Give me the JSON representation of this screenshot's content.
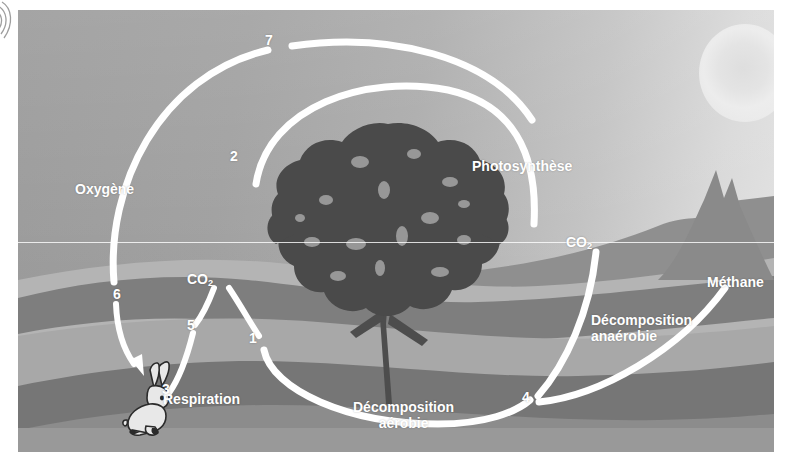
{
  "diagram": {
    "language": "fr",
    "colors": {
      "arc": "#ffffff",
      "label_text": "#ffffff",
      "sky_dark": "#9a9a9a",
      "sky_light": "#e4e4e4",
      "ground_light": "#b5b5b5",
      "ground_mid": "#8e8e8e",
      "ground_dark": "#6f6f6f",
      "tree": "#4a4a4a",
      "sun": "#dedede"
    }
  },
  "labels": [
    {
      "id": "oxygene",
      "text": "Oxygène",
      "x": 75,
      "y": 172,
      "size": 14
    },
    {
      "id": "photosynthese",
      "text": "Photosynthèse",
      "x": 472,
      "y": 149,
      "size": 14
    },
    {
      "id": "co2-left",
      "text": "CO",
      "sub": "2",
      "x": 187,
      "y": 264,
      "size": 14
    },
    {
      "id": "co2-right",
      "text": "CO",
      "sub": "2",
      "x": 566,
      "y": 227,
      "size": 14
    },
    {
      "id": "methane",
      "text": "Méthane",
      "x": 707,
      "y": 267,
      "size": 14
    },
    {
      "id": "respiration",
      "text": "Respiration",
      "x": 163,
      "y": 393,
      "size": 14
    },
    {
      "id": "decomposition-aerobie",
      "text": "Décomposition\naérobie",
      "x": 355,
      "y": 398,
      "size": 14,
      "align": "center"
    },
    {
      "id": "decomposition-anaerobie",
      "text": "Décomposition\nanaérobie",
      "x": 591,
      "y": 313,
      "size": 14
    }
  ],
  "step_numbers": [
    {
      "id": "step-1",
      "value": "1",
      "x": 240,
      "y": 329,
      "size": 14
    },
    {
      "id": "step-2",
      "value": "2",
      "x": 221,
      "y": 147,
      "size": 14
    },
    {
      "id": "step-3",
      "value": "3",
      "x": 153,
      "y": 380,
      "size": 14
    },
    {
      "id": "step-4",
      "value": "4",
      "x": 513,
      "y": 389,
      "size": 14
    },
    {
      "id": "step-5",
      "value": "5",
      "x": 178,
      "y": 316,
      "size": 14
    },
    {
      "id": "step-6",
      "value": "6",
      "x": 104,
      "y": 285,
      "size": 14
    },
    {
      "id": "step-7",
      "value": "7",
      "x": 256,
      "y": 31,
      "size": 14
    }
  ],
  "arcs": [
    {
      "id": "arc-oxygen-outer",
      "d": "M 96 272 C 90 170 150 60 252 40",
      "width": 7.5
    },
    {
      "id": "arc-oxygen-top",
      "d": "M 272 38 C 370 24 470 48 512 108",
      "width": 7.5
    },
    {
      "id": "arc-photosynthesis",
      "d": "M 238 172 C 252 96 350 66 430 80 C 492 92 518 140 516 212",
      "width": 7.5
    },
    {
      "id": "arc-co2-to-rabbit",
      "d": "M 196 276 C 190 292 184 304 176 314",
      "width": 6.5
    },
    {
      "id": "arc-co2-to-ground",
      "d": "M 210 276 C 222 294 232 312 240 324",
      "width": 6.5
    },
    {
      "id": "arc-respiration",
      "d": "M 174 322 C 168 346 160 368 150 382",
      "width": 6.5
    },
    {
      "id": "arc-decomp-aerobic",
      "d": "M 246 338 C 254 378 330 412 420 412 C 468 412 498 402 512 390",
      "width": 7.5
    },
    {
      "id": "arc-co2-right-down",
      "d": "M 578 240 C 572 300 548 352 520 384",
      "width": 7.5
    },
    {
      "id": "arc-methane",
      "d": "M 520 392 C 580 386 660 340 706 278",
      "width": 7.5
    },
    {
      "id": "arc-oxygen-arrow-stem",
      "d": "M 99 292 C 100 318 108 340 118 356",
      "width": 6.5
    }
  ],
  "scene": {
    "sun": {
      "x": 681,
      "y": 14,
      "size": 92
    },
    "horizon_artifact_y": 232,
    "tree": {
      "x": 246,
      "y": 108,
      "w": 248,
      "h": 292
    },
    "rabbit": {
      "x": 104,
      "y": 356,
      "w": 66,
      "h": 72
    }
  }
}
